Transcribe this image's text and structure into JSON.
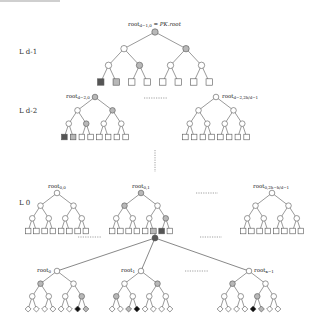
{
  "colors": {
    "edge": "#555555",
    "node_white": "#ffffff",
    "node_gray": "#b8b8b8",
    "node_dark": "#555555",
    "node_black": "#111111",
    "dotted": "#888888"
  },
  "levels": {
    "ld1": "L d-1",
    "ld2": "L d-2",
    "l0": "L 0"
  },
  "labels": {
    "top_root_main": "root",
    "top_root_sub": "d−1,0",
    "top_root_suffix": " = PK.root",
    "ld2_left_main": "root",
    "ld2_left_sub": "d−2,0",
    "ld2_right_main": "root",
    "ld2_right_sub": "d−2,2h/d−1",
    "l0_a_main": "root",
    "l0_a_sub": "0,0",
    "l0_b_main": "root",
    "l0_b_sub": "0,1",
    "l0_c_main": "root",
    "l0_c_sub": "0,2h−h/d−1",
    "wots_0_main": "root",
    "wots_0_sub": "0",
    "wots_1_main": "root",
    "wots_1_sub": "1",
    "wots_k_main": "root",
    "wots_k_sub": "κ−1"
  },
  "trees": [
    {
      "id": "ld1-tree",
      "cx": 155,
      "top": 32,
      "w": 124,
      "h": 50,
      "shape": "square",
      "nodes": [
        "g",
        "w",
        "g",
        "w",
        "g",
        "w",
        "w",
        "D",
        "G",
        "W",
        "W",
        "W",
        "W",
        "W",
        "W"
      ]
    },
    {
      "id": "ld2-left",
      "cx": 95,
      "top": 97,
      "w": 70,
      "h": 40,
      "shape": "square",
      "nodes": [
        "g",
        "w",
        "g",
        "w",
        "g",
        "w",
        "w",
        "D",
        "G",
        "W",
        "W",
        "W",
        "W",
        "W",
        "W"
      ]
    },
    {
      "id": "ld2-right",
      "cx": 216,
      "top": 97,
      "w": 70,
      "h": 40,
      "shape": "square",
      "nodes": [
        "w",
        "w",
        "w",
        "w",
        "w",
        "w",
        "w",
        "W",
        "W",
        "W",
        "W",
        "W",
        "W",
        "W",
        "W"
      ]
    },
    {
      "id": "l0-a",
      "cx": 57,
      "top": 193,
      "w": 66,
      "h": 38,
      "shape": "square",
      "nodes": [
        "w",
        "w",
        "w",
        "w",
        "w",
        "w",
        "w",
        "W",
        "W",
        "W",
        "W",
        "W",
        "W",
        "W",
        "W"
      ]
    },
    {
      "id": "l0-b",
      "cx": 141,
      "top": 193,
      "w": 66,
      "h": 38,
      "shape": "square",
      "nodes": [
        "g",
        "g",
        "w",
        "w",
        "w",
        "w",
        "g",
        "W",
        "W",
        "W",
        "W",
        "W",
        "G",
        "D",
        "W"
      ]
    },
    {
      "id": "l0-c",
      "cx": 272,
      "top": 193,
      "w": 66,
      "h": 38,
      "shape": "square",
      "nodes": [
        "w",
        "w",
        "w",
        "w",
        "w",
        "w",
        "w",
        "W",
        "W",
        "W",
        "W",
        "W",
        "W",
        "W",
        "W"
      ]
    },
    {
      "id": "wots-0",
      "cx": 57,
      "top": 271,
      "w": 66,
      "h": 38,
      "shape": "diamond",
      "nodes": [
        "w",
        "g",
        "w",
        "w",
        "w",
        "w",
        "g",
        "W",
        "W",
        "W",
        "W",
        "W",
        "W",
        "B",
        "G"
      ]
    },
    {
      "id": "wots-1",
      "cx": 141,
      "top": 271,
      "w": 66,
      "h": 38,
      "shape": "diamond",
      "nodes": [
        "w",
        "w",
        "g",
        "g",
        "w",
        "w",
        "w",
        "W",
        "W",
        "G",
        "B",
        "W",
        "W",
        "W",
        "W"
      ]
    },
    {
      "id": "wots-k",
      "cx": 249,
      "top": 271,
      "w": 66,
      "h": 38,
      "shape": "diamond",
      "nodes": [
        "w",
        "g",
        "w",
        "w",
        "w",
        "g",
        "w",
        "W",
        "W",
        "W",
        "W",
        "B",
        "G",
        "W",
        "W"
      ]
    }
  ],
  "hub": {
    "x": 155,
    "y": 238
  }
}
